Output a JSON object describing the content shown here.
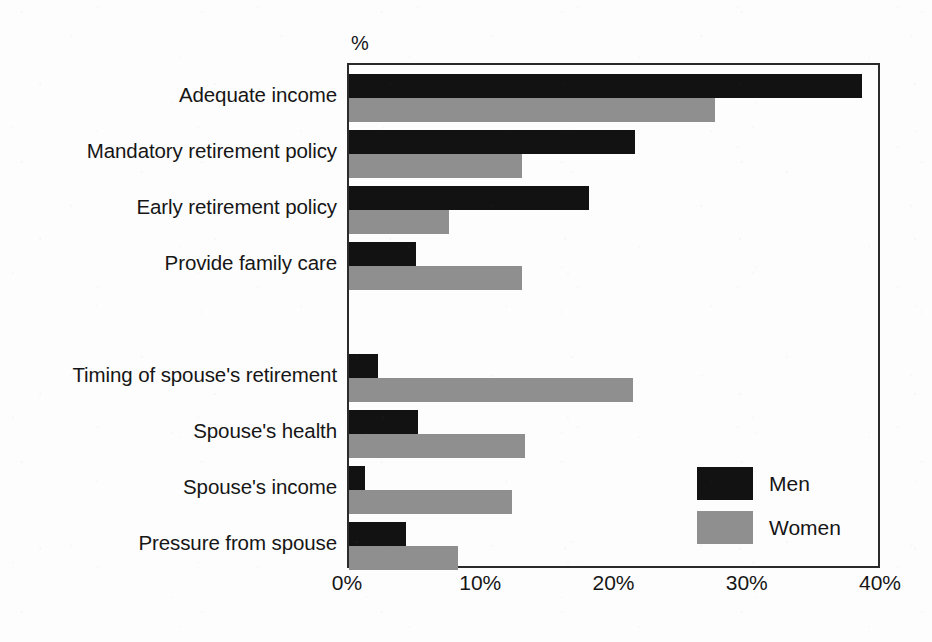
{
  "chart_data": {
    "type": "bar",
    "orientation": "horizontal",
    "title": "",
    "xlabel": "%",
    "ylabel": "",
    "unit_label": "%",
    "xlim": [
      0,
      40
    ],
    "xticks": [
      0,
      10,
      20,
      30,
      40
    ],
    "xticklabels": [
      "0%",
      "10%",
      "20%",
      "30%",
      "40%"
    ],
    "grid": false,
    "legend_position": "inside-bottom-right",
    "categories": [
      "Adequate income",
      "Mandatory retirement policy",
      "Early retirement policy",
      "Provide family care",
      "Timing of spouse's retirement",
      "Spouse's health",
      "Spouse's income",
      "Pressure from spouse"
    ],
    "group_break_after_index": 3,
    "series": [
      {
        "name": "Men",
        "color": "#121212",
        "values": [
          38.5,
          21.5,
          18.0,
          5.0,
          2.2,
          5.2,
          1.2,
          4.3
        ]
      },
      {
        "name": "Women",
        "color": "#8f8f8f",
        "values": [
          27.5,
          13.0,
          7.5,
          13.0,
          21.3,
          13.2,
          12.2,
          8.2
        ]
      }
    ]
  },
  "legend": {
    "items": [
      {
        "label": "Men",
        "swatch": "men"
      },
      {
        "label": "Women",
        "swatch": "women"
      }
    ]
  }
}
